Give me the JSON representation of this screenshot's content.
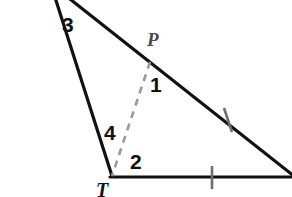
{
  "figure": {
    "kind": "geometry-diagram",
    "background_color": "#ffffff",
    "stroke_color": "#111111",
    "dashed_color": "#9a9a9a",
    "tick_color": "#6e6e6e",
    "labels": {
      "angle_1": "1",
      "angle_2": "2",
      "angle_3": "3",
      "angle_4": "4",
      "point_p": "P",
      "vertex_t": "T"
    },
    "points": {
      "apex": {
        "x": 52,
        "y": -12
      },
      "vertex_t": {
        "x": 112,
        "y": 176
      },
      "point_p": {
        "x": 150,
        "y": 62
      },
      "right_hyp": {
        "x": 292,
        "y": 175
      },
      "right_base": {
        "x": 292,
        "y": 177
      }
    },
    "segments": [
      {
        "name": "left-side",
        "from": "apex",
        "to": "vertex_t",
        "style": "solid"
      },
      {
        "name": "hypotenuse",
        "from": "apex",
        "to": "right_hyp",
        "style": "solid"
      },
      {
        "name": "base",
        "from": "vertex_t",
        "to": "right_base",
        "style": "solid"
      },
      {
        "name": "cevian",
        "from": "point_p",
        "to": "vertex_t",
        "style": "dashed"
      }
    ],
    "tick_marks": [
      {
        "name": "hypotenuse-tick",
        "x": 228,
        "y": 120,
        "rotation_deg": 12
      },
      {
        "name": "base-tick",
        "x": 212,
        "y": 177,
        "rotation_deg": 0
      }
    ]
  }
}
